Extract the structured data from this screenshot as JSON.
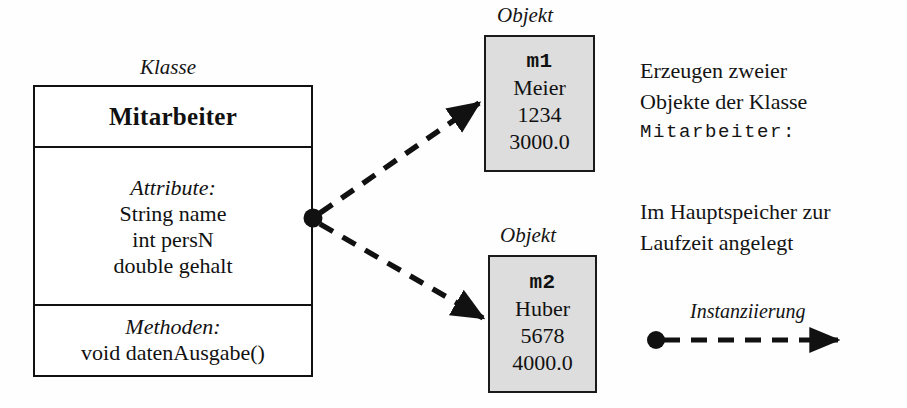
{
  "diagram": {
    "title_class_label": "Klasse",
    "class_box": {
      "name": "Mitarbeiter",
      "attributes_heading": "Attribute:",
      "attributes": [
        "String name",
        "int persN",
        "double gehalt"
      ],
      "methods_heading": "Methoden:",
      "methods": [
        "void datenAusgabe()"
      ]
    },
    "objects": [
      {
        "caption": "Objekt",
        "id": "m1",
        "values": [
          "Meier",
          "1234",
          "3000.0"
        ]
      },
      {
        "caption": "Objekt",
        "id": "m2",
        "values": [
          "Huber",
          "5678",
          "4000.0"
        ]
      }
    ],
    "annotations": {
      "note1_line1": "Erzeugen zweier",
      "note1_line2": "Objekte der Klasse",
      "note1_line3": "Mitarbeiter:",
      "note2_line1": "Im Hauptspeicher zur",
      "note2_line2": "Laufzeit angelegt"
    },
    "legend": {
      "label": "Instanziierung"
    },
    "colors": {
      "stroke": "#111111",
      "object_fill": "#dddddd",
      "class_fill": "#ffffff",
      "background": "#fefefe"
    }
  }
}
